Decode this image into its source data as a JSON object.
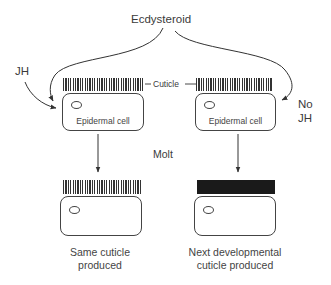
{
  "diagram": {
    "top_label": "Ecdysteroid",
    "left_hormone": "JH",
    "right_hormone_line1": "No",
    "right_hormone_line2": "JH",
    "cuticle_label": "Cuticle",
    "cell_label": "Epidermal cell",
    "process_label": "Molt",
    "left_outcome": {
      "line1": "Same cuticle",
      "line2": "produced"
    },
    "right_outcome": {
      "line1": "Next developmental",
      "line2": "cuticle produced"
    },
    "colors": {
      "line": "#333333",
      "solid_cuticle": "#1a1a1a",
      "background": "#ffffff"
    }
  }
}
